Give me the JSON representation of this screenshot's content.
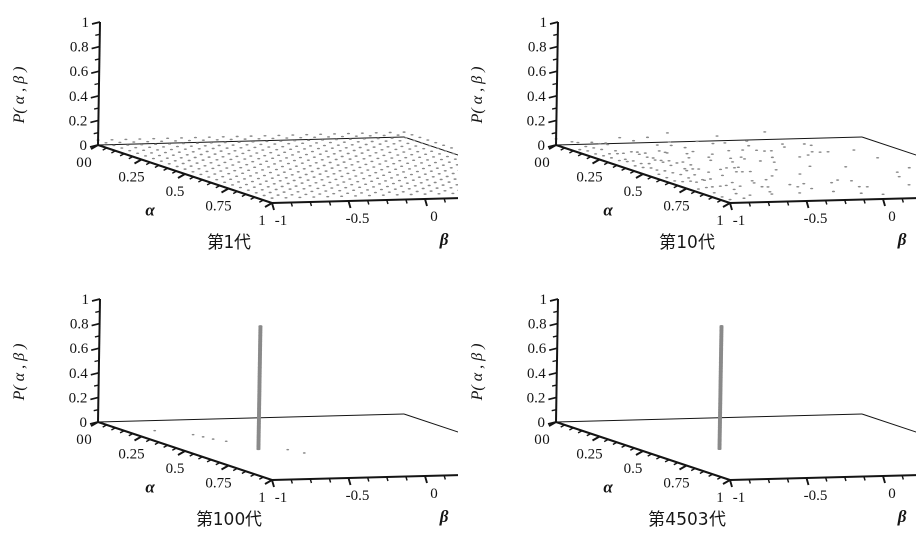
{
  "figure": {
    "background": "#ffffff",
    "ink": "#141414",
    "marker_color": "#8a8a8a",
    "panel_width": 458,
    "panel_height": 277
  },
  "axes": {
    "z_label": "P( α , β )",
    "z_label_plain": "P(alpha, beta)",
    "x_label": "α",
    "y_label": "β",
    "z_ticks": [
      "0",
      "0.2",
      "0.4",
      "0.6",
      "0.8",
      "1"
    ],
    "z_tick_values": [
      0,
      0.2,
      0.4,
      0.6,
      0.8,
      1
    ],
    "x_ticks": [
      "0",
      "0.25",
      "0.5",
      "0.75",
      "1"
    ],
    "x_tick_values": [
      0,
      0.25,
      0.5,
      0.75,
      1
    ],
    "y_ticks": [
      "-1",
      "-0.5",
      "0",
      "0.5",
      "1"
    ],
    "y_tick_values": [
      -1,
      -0.5,
      0,
      0.5,
      1
    ],
    "x_range": [
      0,
      1
    ],
    "y_range": [
      -1,
      1
    ],
    "z_range": [
      0,
      1
    ]
  },
  "panels": [
    {
      "id": "gen-1",
      "caption": "第1代",
      "caption_plain": "Generation 1",
      "pattern": "uniform-grid",
      "description": "Dense uniform lattice of low-height markers covering the whole alpha-beta base plane."
    },
    {
      "id": "gen-10",
      "caption": "第10代",
      "caption_plain": "Generation 10",
      "pattern": "clustered-sparse",
      "description": "Markers concentrated toward small alpha / negative beta, thinning out toward large beta with a few isolated dots."
    },
    {
      "id": "gen-100",
      "caption": "第100代",
      "caption_plain": "Generation 100",
      "pattern": "single-spike-with-trail",
      "spike": {
        "alpha": 0.5,
        "beta": -0.52,
        "height": 1.0
      },
      "description": "One tall spike reaching P=1 plus a short dashed trail of low markers on the base plane."
    },
    {
      "id": "gen-4503",
      "caption": "第4503代",
      "caption_plain": "Generation 4503",
      "pattern": "single-spike",
      "spike": {
        "alpha": 0.5,
        "beta": -0.5,
        "height": 1.0
      },
      "description": "A single clean spike reaching P=1; base plane otherwise empty."
    }
  ],
  "chart_data": {
    "type": "scatter",
    "title": "",
    "subtitle": "",
    "xlabel": "α",
    "ylabel": "β",
    "zlabel": "P( α , β )",
    "projection": "3d",
    "grid": false,
    "legend": "none",
    "xlim": [
      0,
      1
    ],
    "ylim": [
      -1,
      1
    ],
    "zlim": [
      0,
      1
    ],
    "xticks": [
      0,
      0.25,
      0.5,
      0.75,
      1
    ],
    "yticks": [
      -1,
      -0.5,
      0,
      0.5,
      1
    ],
    "zticks": [
      0,
      0.2,
      0.4,
      0.6,
      0.8,
      1
    ],
    "panels": [
      {
        "name": "第1代",
        "kind": "uniform-sheet",
        "note": "P(alpha,beta) ~ 0.04 uniformly over a 22x22 lattice",
        "grid_nx": 22,
        "grid_ny": 22,
        "value": 0.04
      },
      {
        "name": "第10代",
        "kind": "sparse-cluster",
        "note": "occupancy probability decreasing with beta; ~45% fill near beta=-1, ~3% near beta=1",
        "grid_nx": 22,
        "grid_ny": 22,
        "value": 0.045
      },
      {
        "name": "第100代",
        "kind": "spike",
        "spike_alpha": 0.5,
        "spike_beta": -0.52,
        "spike_value": 1.0,
        "trail": [
          {
            "alpha": 0.3,
            "beta": -0.72,
            "value": 0.03
          },
          {
            "alpha": 0.34,
            "beta": -0.7,
            "value": 0.03
          },
          {
            "alpha": 0.38,
            "beta": -0.68,
            "value": 0.03
          },
          {
            "alpha": 0.42,
            "beta": -0.64,
            "value": 0.03
          },
          {
            "alpha": 0.58,
            "beta": -0.42,
            "value": 0.03
          },
          {
            "alpha": 0.64,
            "beta": -0.38,
            "value": 0.03
          },
          {
            "alpha": 0.22,
            "beta": -0.88,
            "value": 0.03
          }
        ]
      },
      {
        "name": "第4503代",
        "kind": "spike",
        "spike_alpha": 0.5,
        "spike_beta": -0.5,
        "spike_value": 1.0,
        "trail": []
      }
    ]
  }
}
